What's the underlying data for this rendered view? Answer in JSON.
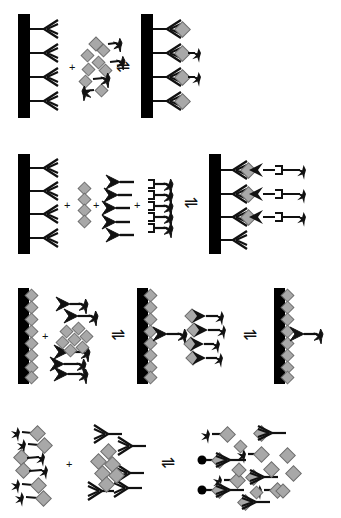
{
  "figure": {
    "background_color": "#ffffff",
    "width": 341,
    "height": 518
  },
  "palette": {
    "solid_support": "#000000",
    "antigen_diamond_fill": "#a8a8a8",
    "antigen_diamond_stroke": "#6e6e6e",
    "label_star": "#111111",
    "antibody_outline_stroke": "#111111",
    "antibody_outline_fill": "#ffffff",
    "antibody_solid_fill": "#111111",
    "bead_dot": "#000000",
    "linker_line": "#111111"
  },
  "symbols": {
    "solid_phase": "solid-support-bar",
    "capture_antibody": "outline-antibody",
    "detection_antibody": "solid-antibody",
    "antigen": "gray-diamond",
    "label": "black-star",
    "linker": "bracket-linker",
    "bead": "black-dot",
    "plus": "+",
    "equilibrium": "⇌"
  },
  "panels": [
    {
      "id": "row-1",
      "name": "direct-competitive-assay",
      "y": 8,
      "height": 128,
      "reagents": [
        {
          "id": "r1-plate",
          "name": "capture-antibody-plate",
          "type": "plate",
          "x": 18,
          "bar": {
            "x": 18,
            "y": 14,
            "w": 12,
            "h": 104
          },
          "antibodies": [
            {
              "x": 30,
              "y": 29,
              "style": "outline",
              "dir": "right",
              "stem": 14
            },
            {
              "x": 30,
              "y": 53,
              "style": "outline",
              "dir": "right",
              "stem": 14
            },
            {
              "x": 30,
              "y": 77,
              "style": "outline",
              "dir": "right",
              "stem": 14
            },
            {
              "x": 30,
              "y": 101,
              "style": "outline",
              "dir": "right",
              "stem": 14
            }
          ]
        },
        {
          "id": "r1-plus",
          "name": "plus-sign",
          "type": "plus",
          "x": 71,
          "y": 66
        },
        {
          "id": "r1-mix",
          "name": "free-antigen-and-labeled-antigen-mix",
          "type": "mix",
          "diamonds": [
            {
              "x": 95,
              "y": 44
            },
            {
              "x": 102,
              "y": 50
            },
            {
              "x": 87,
              "y": 55
            },
            {
              "x": 98,
              "y": 62
            },
            {
              "x": 88,
              "y": 68
            },
            {
              "x": 104,
              "y": 70
            },
            {
              "x": 85,
              "y": 79
            },
            {
              "x": 99,
              "y": 88
            }
          ],
          "labeled_antigens": [
            {
              "x": 106,
              "y": 44,
              "dir": "left",
              "len": 9
            },
            {
              "x": 108,
              "y": 62,
              "dir": "left",
              "len": 11
            },
            {
              "x": 99,
              "y": 79,
              "dir": "left",
              "len": 12
            },
            {
              "x": 83,
              "y": 88,
              "dir": "right",
              "len": 11
            }
          ]
        },
        {
          "id": "r1-eq",
          "name": "equilibrium-arrow",
          "type": "equilibrium",
          "x": 118,
          "y": 61
        },
        {
          "id": "r1-product",
          "name": "bound-complex-plate",
          "type": "plate",
          "bar": {
            "x": 141,
            "y": 14,
            "w": 12,
            "h": 104
          },
          "complexes": [
            {
              "x": 153,
              "y": 29,
              "stem": 14,
              "antigen": true,
              "label": false
            },
            {
              "x": 153,
              "y": 53,
              "stem": 14,
              "antigen": true,
              "label": true
            },
            {
              "x": 153,
              "y": 77,
              "stem": 14,
              "antigen": true,
              "label": true
            },
            {
              "x": 153,
              "y": 101,
              "stem": 14,
              "antigen": true,
              "label": false
            }
          ]
        }
      ]
    },
    {
      "id": "row-2",
      "name": "sandwich-assay",
      "y": 148,
      "height": 118,
      "reagents": [
        {
          "id": "r2-plate",
          "name": "capture-antibody-plate",
          "type": "plate",
          "bar": {
            "x": 18,
            "y": 152,
            "w": 12,
            "h": 100
          },
          "antibodies": [
            {
              "x": 30,
              "y": 166,
              "style": "outline",
              "dir": "right",
              "stem": 14
            },
            {
              "x": 30,
              "y": 189,
              "style": "outline",
              "dir": "right",
              "stem": 14
            },
            {
              "x": 30,
              "y": 212,
              "style": "outline",
              "dir": "right",
              "stem": 14
            },
            {
              "x": 30,
              "y": 236,
              "style": "outline",
              "dir": "right",
              "stem": 14
            }
          ]
        },
        {
          "id": "r2-plus-1",
          "name": "plus-sign",
          "type": "plus",
          "x": 66,
          "y": 203
        },
        {
          "id": "r2-antigen",
          "name": "free-antigen-column",
          "type": "antigen-column",
          "diamonds": [
            {
              "x": 81,
              "y": 189
            },
            {
              "x": 81,
              "y": 200
            },
            {
              "x": 81,
              "y": 211
            },
            {
              "x": 81,
              "y": 222
            }
          ]
        },
        {
          "id": "r2-plus-2",
          "name": "plus-sign",
          "type": "plus",
          "x": 95,
          "y": 203
        },
        {
          "id": "r2-detection-ab",
          "name": "detection-antibody-group",
          "type": "antibody-column",
          "antibodies": [
            {
              "x": 110,
              "y": 184,
              "style": "solid",
              "dir": "left",
              "stem": 14
            },
            {
              "x": 108,
              "y": 197,
              "style": "solid",
              "dir": "left",
              "stem": 14
            },
            {
              "x": 106,
              "y": 210,
              "style": "solid",
              "dir": "left",
              "stem": 14
            },
            {
              "x": 106,
              "y": 224,
              "style": "solid",
              "dir": "left",
              "stem": 14
            },
            {
              "x": 110,
              "y": 237,
              "style": "solid",
              "dir": "left",
              "stem": 14
            }
          ]
        },
        {
          "id": "r2-plus-3",
          "name": "plus-sign",
          "type": "plus",
          "x": 136,
          "y": 203
        },
        {
          "id": "r2-label",
          "name": "labeled-linker-column",
          "type": "linker-column",
          "linkers": [
            {
              "x": 148,
              "y": 186,
              "len": 22
            },
            {
              "x": 148,
              "y": 196,
              "len": 22
            },
            {
              "x": 148,
              "y": 207,
              "len": 22
            },
            {
              "x": 148,
              "y": 217,
              "len": 22
            },
            {
              "x": 148,
              "y": 228,
              "len": 22
            }
          ]
        },
        {
          "id": "r2-eq",
          "name": "equilibrium-arrow",
          "type": "equilibrium",
          "x": 186,
          "y": 198
        },
        {
          "id": "r2-product",
          "name": "sandwich-complex-plate",
          "type": "plate",
          "bar": {
            "x": 209,
            "y": 152,
            "w": 12,
            "h": 100
          },
          "sandwiches": [
            {
              "x": 221,
              "y": 168,
              "complete": true
            },
            {
              "x": 221,
              "y": 192,
              "complete": true
            },
            {
              "x": 221,
              "y": 215,
              "complete": true
            },
            {
              "x": 221,
              "y": 239,
              "complete": false
            }
          ]
        }
      ]
    },
    {
      "id": "row-3",
      "name": "competitive-coated-antigen-assay",
      "y": 280,
      "height": 112,
      "reagents": [
        {
          "id": "r3-plate-1",
          "name": "antigen-coated-plate",
          "type": "coated-plate",
          "bar": {
            "x": 18,
            "y": 288,
            "w": 11,
            "h": 96
          },
          "coated": [
            {
              "x": 31,
              "y": 295
            },
            {
              "x": 31,
              "y": 307
            },
            {
              "x": 31,
              "y": 319
            },
            {
              "x": 31,
              "y": 331
            },
            {
              "x": 31,
              "y": 343
            },
            {
              "x": 31,
              "y": 355
            },
            {
              "x": 31,
              "y": 367
            },
            {
              "x": 31,
              "y": 377
            }
          ]
        },
        {
          "id": "r3-plus",
          "name": "plus-sign",
          "type": "plus",
          "x": 44,
          "y": 335
        },
        {
          "id": "r3-mix",
          "name": "labeled-antibody-and-antigen-mix",
          "type": "mix",
          "conjugates": [
            {
              "x": 62,
              "y": 306,
              "dir": "left",
              "len": 14
            },
            {
              "x": 72,
              "y": 318,
              "dir": "left",
              "len": 16
            },
            {
              "x": 60,
              "y": 353,
              "dir": "left",
              "len": 18
            },
            {
              "x": 56,
              "y": 365,
              "dir": "left",
              "len": 18
            },
            {
              "x": 60,
              "y": 375,
              "dir": "left",
              "len": 16
            }
          ],
          "diamonds": [
            {
              "x": 66,
              "y": 328
            },
            {
              "x": 78,
              "y": 325
            },
            {
              "x": 62,
              "y": 339
            },
            {
              "x": 74,
              "y": 336
            },
            {
              "x": 86,
              "y": 333
            },
            {
              "x": 70,
              "y": 347
            },
            {
              "x": 82,
              "y": 344
            }
          ]
        },
        {
          "id": "r3-eq-1",
          "name": "equilibrium-arrow",
          "type": "equilibrium",
          "x": 113,
          "y": 330
        },
        {
          "id": "r3-plate-2",
          "name": "partially-bound-antigen-plate",
          "type": "coated-plate",
          "bar": {
            "x": 137,
            "y": 288,
            "w": 11,
            "h": 96
          },
          "coated": [
            {
              "x": 150,
              "y": 295
            },
            {
              "x": 150,
              "y": 307
            },
            {
              "x": 150,
              "y": 319
            },
            {
              "x": 150,
              "y": 331
            },
            {
              "x": 150,
              "y": 343
            },
            {
              "x": 150,
              "y": 355
            },
            {
              "x": 150,
              "y": 367
            },
            {
              "x": 150,
              "y": 377
            }
          ],
          "bound": [
            {
              "x": 155,
              "y": 335,
              "len": 18
            }
          ]
        },
        {
          "id": "r3-mix-2",
          "name": "displaced-complex-mix",
          "type": "mix",
          "conjugates": [
            {
              "x": 198,
              "y": 318,
              "dir": "left",
              "len": 16,
              "antigen": true
            },
            {
              "x": 200,
              "y": 332,
              "dir": "left",
              "len": 16,
              "antigen": true
            },
            {
              "x": 192,
              "y": 346,
              "dir": "left",
              "len": 14,
              "antigen": true
            },
            {
              "x": 196,
              "y": 360,
              "dir": "left",
              "len": 15,
              "antigen": true
            }
          ]
        },
        {
          "id": "r3-eq-2",
          "name": "equilibrium-arrow",
          "type": "equilibrium",
          "x": 245,
          "y": 330
        },
        {
          "id": "r3-plate-3",
          "name": "final-bound-plate",
          "type": "coated-plate",
          "bar": {
            "x": 274,
            "y": 288,
            "w": 11,
            "h": 96
          },
          "coated": [
            {
              "x": 287,
              "y": 295
            },
            {
              "x": 287,
              "y": 307
            },
            {
              "x": 287,
              "y": 319
            },
            {
              "x": 287,
              "y": 331
            },
            {
              "x": 287,
              "y": 343
            },
            {
              "x": 287,
              "y": 355
            },
            {
              "x": 287,
              "y": 367
            },
            {
              "x": 287,
              "y": 377
            }
          ],
          "bound": [
            {
              "x": 292,
              "y": 335,
              "len": 17
            }
          ]
        }
      ]
    },
    {
      "id": "row-4",
      "name": "homogeneous-solution-phase-assay",
      "y": 412,
      "height": 100,
      "reagents": [
        {
          "id": "r4-tracer",
          "name": "labeled-antigen-tracer-group",
          "type": "tracer-group",
          "tracers": [
            {
              "x": 20,
              "y": 432,
              "dir": "right",
              "len": 13
            },
            {
              "x": 26,
              "y": 443,
              "dir": "right",
              "len": 13
            },
            {
              "x": 18,
              "y": 455,
              "dir": "left",
              "len": 15
            },
            {
              "x": 20,
              "y": 466,
              "dir": "left",
              "len": 16
            },
            {
              "x": 18,
              "y": 478,
              "dir": "right",
              "len": 14
            },
            {
              "x": 24,
              "y": 489,
              "dir": "right",
              "len": 14
            }
          ]
        },
        {
          "id": "r4-plus",
          "name": "plus-sign",
          "type": "plus",
          "x": 68,
          "y": 463
        },
        {
          "id": "r4-reagent",
          "name": "free-antibody-and-antigen-group",
          "type": "mix",
          "antibodies": [
            {
              "x": 102,
              "y": 433,
              "style": "outline",
              "dir": "left",
              "stem": 16
            },
            {
              "x": 126,
              "y": 445,
              "style": "outline",
              "dir": "left",
              "stem": 16
            },
            {
              "x": 124,
              "y": 472,
              "style": "outline",
              "dir": "left",
              "stem": 16
            },
            {
              "x": 96,
              "y": 490,
              "style": "outline",
              "dir": "left",
              "stem": 16
            },
            {
              "x": 122,
              "y": 487,
              "style": "outline",
              "dir": "left",
              "stem": 16
            }
          ],
          "diamonds": [
            {
              "x": 108,
              "y": 450
            },
            {
              "x": 98,
              "y": 459
            },
            {
              "x": 112,
              "y": 462
            },
            {
              "x": 102,
              "y": 470
            },
            {
              "x": 116,
              "y": 473
            },
            {
              "x": 106,
              "y": 481
            }
          ]
        },
        {
          "id": "r4-eq",
          "name": "equilibrium-arrow",
          "type": "equilibrium",
          "x": 163,
          "y": 458
        },
        {
          "id": "r4-product",
          "name": "bound-and-free-complex-mixture",
          "type": "complex-mix",
          "free_tracers": [
            {
              "x": 216,
              "y": 432,
              "dir": "right",
              "len": 13
            },
            {
              "x": 230,
              "y": 478,
              "dir": "right",
              "len": 12
            },
            {
              "x": 252,
              "y": 468,
              "dir": "right",
              "len": 12
            },
            {
              "x": 268,
              "y": 456,
              "dir": "right",
              "len": 12
            }
          ],
          "bound_complexes": [
            {
              "x": 262,
              "y": 430,
              "bead": false
            },
            {
              "x": 222,
              "y": 458,
              "bead": true
            },
            {
              "x": 260,
              "y": 462,
              "bead": false
            },
            {
              "x": 222,
              "y": 486,
              "bead": true
            },
            {
              "x": 248,
              "y": 494,
              "bead": false
            }
          ],
          "loose_diamonds": [
            {
              "x": 240,
              "y": 444
            },
            {
              "x": 270,
              "y": 444
            },
            {
              "x": 236,
              "y": 464
            },
            {
              "x": 284,
              "y": 470
            },
            {
              "x": 258,
              "y": 482
            },
            {
              "x": 280,
              "y": 490
            }
          ]
        }
      ]
    }
  ]
}
